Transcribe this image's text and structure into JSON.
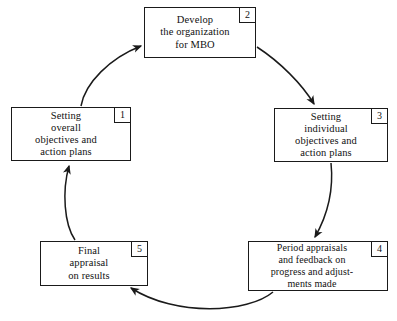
{
  "diagram": {
    "stroke_color": "#1a1a1a",
    "background_color": "#ffffff",
    "nodes": [
      {
        "id": "node1",
        "number": "1",
        "label": "Setting\noverall\nobjectives and\naction plans"
      },
      {
        "id": "node2",
        "number": "2",
        "label": "Develop\nthe organization\nfor MBO"
      },
      {
        "id": "node3",
        "number": "3",
        "label": "Setting\nindividual\nobjectives and\naction plans"
      },
      {
        "id": "node4",
        "number": "4",
        "label": "Period appraisals\nand feedback on\nprogress and adjust-\nments made"
      },
      {
        "id": "node5",
        "number": "5",
        "label": "Final\nappraisal\non results"
      }
    ],
    "arrows": [
      {
        "id": "arrow-1-to-2",
        "from": "node1",
        "to": "node2"
      },
      {
        "id": "arrow-2-to-3",
        "from": "node2",
        "to": "node3"
      },
      {
        "id": "arrow-3-to-4",
        "from": "node3",
        "to": "node4"
      },
      {
        "id": "arrow-4-to-5",
        "from": "node4",
        "to": "node5"
      },
      {
        "id": "arrow-5-to-1",
        "from": "node5",
        "to": "node1"
      }
    ]
  }
}
